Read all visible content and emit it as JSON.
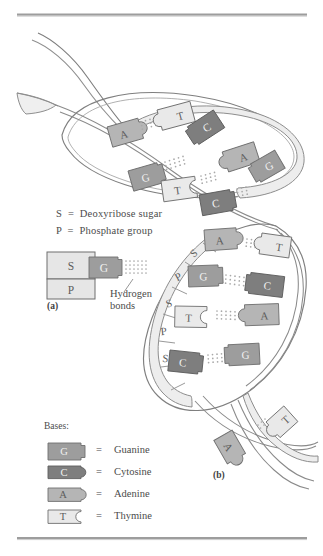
{
  "figure": {
    "rules": {
      "top_rule_color": "#9a9a9a",
      "bottom_rule_color": "#9a9a9a"
    },
    "key": {
      "sugar_line": "S  =  Deoxyribose sugar",
      "phosphate_line": "P  =  Phosphate group",
      "sugar_symbol": "S",
      "sugar_name": "Deoxyribose sugar",
      "phosphate_symbol": "P",
      "phosphate_name": "Phosphate group",
      "equals": "="
    },
    "panel_a": {
      "label": "(a)",
      "sugar_box_label": "S",
      "phosphate_box_label": "P",
      "base_label": "G",
      "hydrogen_bonds_label_line1": "Hydrogen",
      "hydrogen_bonds_label_line2": "bonds"
    },
    "panel_b": {
      "label": "(b)"
    },
    "bases_legend": {
      "heading": "Bases:",
      "equals": "=",
      "items": [
        {
          "symbol": "G",
          "name": "Guanine",
          "color": "#9d9d9d",
          "text_color": "#f2f2f2",
          "shape": "tab-right-square"
        },
        {
          "symbol": "C",
          "name": "Cytosine",
          "color": "#7e7e7e",
          "text_color": "#f2f2f2",
          "shape": "tab-right-round"
        },
        {
          "symbol": "A",
          "name": "Adenine",
          "color": "#b5b5b5",
          "text_color": "#4a4a4a",
          "shape": "bump-right-round"
        },
        {
          "symbol": "T",
          "name": "Thymine",
          "color": "#e4e4e4",
          "text_color": "#4a4a4a",
          "shape": "notch-right-round"
        }
      ]
    },
    "colors": {
      "guanine": "#9d9d9d",
      "cytosine": "#7e7e7e",
      "adenine": "#b5b5b5",
      "thymine": "#e8e8e8",
      "backbone_ribbon": "#ebebeb",
      "backbone_stroke": "#8f8f8f",
      "outline": "#6e6e6e",
      "hbond_dot": "#b0b0b0",
      "page_background": "#ffffff"
    },
    "helix_upper": {
      "description": "Upper open loop of the double helix with four base pairs",
      "base_pairs": [
        {
          "left": "A",
          "right": "T"
        },
        {
          "left": "G",
          "right": "C"
        },
        {
          "left": "T",
          "right": "A"
        },
        {
          "left": "C",
          "right": "G"
        }
      ]
    },
    "helix_lower": {
      "description": "Lower loop of the double helix with labeled sugar-phosphate backbone",
      "backbone_sequence": [
        "S",
        "P",
        "S",
        "P",
        "S"
      ],
      "base_pairs": [
        {
          "left": "A",
          "right": "T"
        },
        {
          "left": "G",
          "right": "C"
        },
        {
          "left": "T",
          "right": "A"
        },
        {
          "left": "C",
          "right": "G"
        }
      ]
    },
    "helix_tail": {
      "description": "Bottom crossing strand with a single base pair",
      "base_pairs": [
        {
          "left": "A",
          "right": "T"
        }
      ]
    }
  }
}
